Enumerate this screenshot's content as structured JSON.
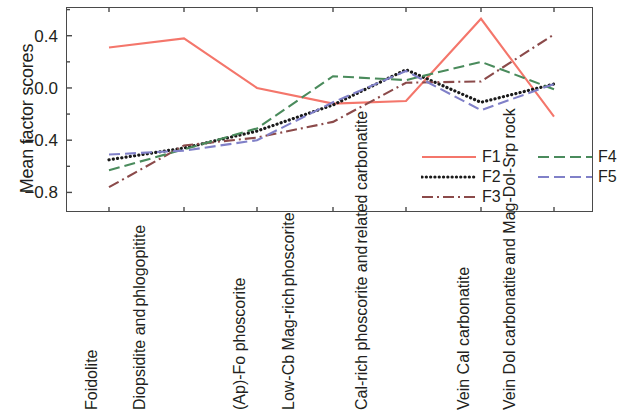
{
  "chart_data": {
    "type": "line",
    "title": "",
    "xlabel": "",
    "ylabel": "Mean factor scores",
    "ylim": [
      -0.95,
      0.62
    ],
    "yticks": [
      0.4,
      0.0,
      -0.4,
      -0.8
    ],
    "ytick_labels": [
      "0.4",
      "0.0",
      "-0.4",
      "-0.8"
    ],
    "minor_ticks": true,
    "grid": false,
    "legend_position": "inside lower-right, two columns",
    "categories": [
      "Foidolite",
      "Diopsidite and phlogopitite",
      "(Ap)-Fo phoscorite",
      "Low-Cb Mag-rich phoscorite",
      "Cal-rich phoscorite and related carbonatite",
      "Vein Cal carbonatite",
      "Vein Dol carbonatite and Mag-Dol-Srp rock"
    ],
    "category_lines": [
      [
        "Foidolite"
      ],
      [
        "Diopsidite and",
        "phlogopitite"
      ],
      [
        "(Ap)-Fo phoscorite"
      ],
      [
        "Low-Cb Mag-rich",
        "phoscorite"
      ],
      [
        "Cal-rich phoscorite and",
        "related carbonatite"
      ],
      [
        "Vein Cal carbonatite"
      ],
      [
        "Vein Dol carbonatite",
        "and Mag-Dol-Srp rock"
      ]
    ],
    "series": [
      {
        "name": "F1",
        "color": "#F4766B",
        "dash": "solid",
        "values": [
          0.31,
          0.38,
          0.0,
          -0.12,
          -0.1,
          0.53,
          -0.22
        ]
      },
      {
        "name": "F2",
        "color": "#1a1a1a",
        "dash": "dotted",
        "values": [
          -0.55,
          -0.46,
          -0.33,
          -0.13,
          0.14,
          -0.11,
          0.03
        ]
      },
      {
        "name": "F3",
        "color": "#8B4A4A",
        "dash": "dashdot",
        "values": [
          -0.76,
          -0.44,
          -0.38,
          -0.26,
          0.04,
          0.05,
          0.41
        ]
      },
      {
        "name": "F4",
        "color": "#4A8B5C",
        "dash": "dashed",
        "values": [
          -0.63,
          -0.47,
          -0.31,
          0.09,
          0.06,
          0.2,
          -0.01
        ]
      },
      {
        "name": "F5",
        "color": "#8080C8",
        "dash": "dashed",
        "values": [
          -0.51,
          -0.48,
          -0.4,
          -0.11,
          0.13,
          -0.17,
          0.03
        ]
      }
    ]
  }
}
